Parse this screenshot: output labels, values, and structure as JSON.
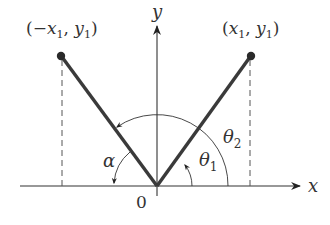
{
  "diagram": {
    "axes": {
      "x_label": "x",
      "y_label": "y",
      "origin_label": "0"
    },
    "points": [
      {
        "label": "(−x₁, y₁)",
        "label_parts": [
          "(−",
          "x",
          "1",
          ", ",
          "y",
          "1",
          ")"
        ]
      },
      {
        "label": "(x₁, y₁)",
        "label_parts": [
          "(",
          "x",
          "1",
          ", ",
          "y",
          "1",
          ")"
        ]
      }
    ],
    "angles": {
      "theta1": {
        "symbol": "θ",
        "sub": "1"
      },
      "theta2": {
        "symbol": "θ",
        "sub": "2"
      },
      "alpha": {
        "symbol": "α"
      }
    },
    "colors": {
      "segment": "#3a3a3a",
      "axis": "#333333",
      "dashed": "#555555"
    }
  }
}
